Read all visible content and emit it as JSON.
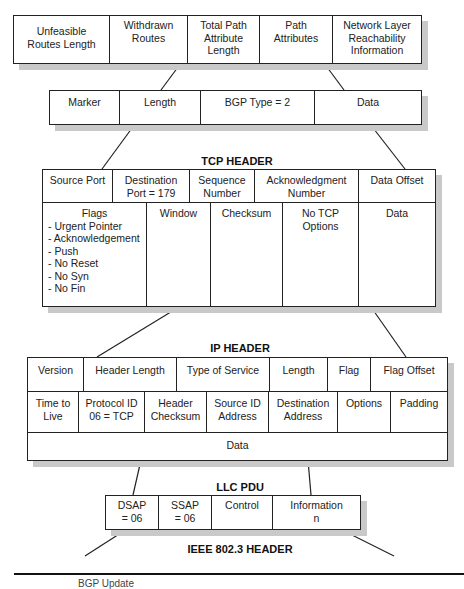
{
  "bgp_update": {
    "fields": [
      "Unfeasible\nRoutes Length",
      "Withdrawn\nRoutes",
      "Total Path\nAttribute\nLength",
      "Path\nAttributes",
      "Network Layer\nReachability\nInformation"
    ]
  },
  "bgp_header": {
    "fields": [
      "Marker",
      "Length",
      "BGP Type = 2",
      "Data"
    ]
  },
  "tcp_header": {
    "title": "TCP HEADER",
    "row1": [
      "Source Port",
      "Destination\nPort = 179",
      "Sequence\nNumber",
      "Acknowledgment\nNumber",
      "Data Offset"
    ],
    "flags": {
      "title": "Flags",
      "items": [
        "- Urgent Pointer",
        "- Acknowledgement",
        "- Push",
        "- No Reset",
        "- No Syn",
        "- No Fin"
      ]
    },
    "row2": [
      "Window",
      "Checksum",
      "No TCP\nOptions",
      "Data"
    ]
  },
  "ip_header": {
    "title": "IP HEADER",
    "row1": [
      "Version",
      "Header Length",
      "Type of Service",
      "Length",
      "Flag",
      "Flag Offset"
    ],
    "row2": [
      "Time to\nLive",
      "Protocol ID\n06 = TCP",
      "Header\nChecksum",
      "Source ID\nAddress",
      "Destination\nAddress",
      "Options",
      "Padding"
    ],
    "row3": "Data"
  },
  "llc_pdu": {
    "title": "LLC PDU",
    "fields": [
      "DSAP\n= 06",
      "SSAP\n= 06",
      "Control",
      "Information\nn"
    ]
  },
  "ieee_header": {
    "title": "IEEE 802.3 HEADER"
  },
  "caption": "BGP Update"
}
